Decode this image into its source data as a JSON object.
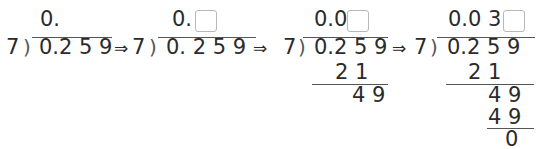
{
  "problem": {
    "divisor": "7",
    "dividend": "0.259",
    "arrow": "⇒"
  },
  "steps": [
    {
      "quotient": "0.",
      "divisor": "7",
      "dividend": "0.2 5 9",
      "has_box": false
    },
    {
      "quotient": "0.",
      "divisor": "7",
      "dividend": "0. 2 5 9",
      "has_box": true
    },
    {
      "quotient": "0.0",
      "divisor": "7",
      "dividend": "0.2 5 9",
      "has_box": true,
      "work": [
        "2 1",
        "4 9"
      ]
    },
    {
      "quotient": "0.0 3",
      "divisor": "7",
      "dividend": "0.2 5 9",
      "has_box": true,
      "work": [
        "2 1",
        "4 9",
        "4 9",
        "0"
      ]
    }
  ],
  "colors": {
    "text": "#2b2b2b",
    "line": "#555555",
    "box_border": "#b8b8b8"
  }
}
